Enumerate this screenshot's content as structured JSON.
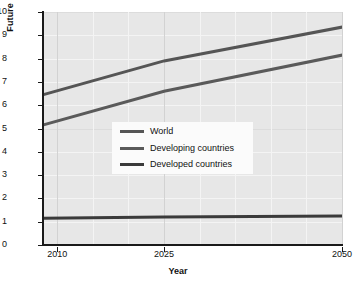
{
  "chart_data": {
    "type": "line",
    "title": "",
    "xlabel": "Year",
    "ylabel": "Future population (billions)",
    "xlim": [
      2008,
      2050
    ],
    "ylim": [
      0,
      10
    ],
    "x_ticks": [
      2010,
      2025,
      2050
    ],
    "x_tick_labels": [
      "2010",
      "2025",
      "2050"
    ],
    "y_ticks": [
      0,
      1,
      2,
      3,
      4,
      5,
      6,
      7,
      8,
      9,
      10
    ],
    "y_tick_labels": [
      "0",
      "1",
      "2",
      "3",
      "4",
      "5",
      "6",
      "7",
      "8",
      "9",
      "10"
    ],
    "grid": true,
    "legend_position": "center",
    "series": [
      {
        "name": "World",
        "color": "#555555",
        "x": [
          2008,
          2025,
          2050
        ],
        "values": [
          6.45,
          7.9,
          9.35
        ]
      },
      {
        "name": "Developing countries",
        "color": "#5a5a5a",
        "x": [
          2008,
          2025,
          2050
        ],
        "values": [
          5.15,
          6.6,
          8.15
        ]
      },
      {
        "name": "Developed countries",
        "color": "#3a3a3a",
        "x": [
          2008,
          2025,
          2050
        ],
        "values": [
          1.15,
          1.2,
          1.25
        ]
      }
    ]
  },
  "axes": {
    "y_title": "Future population (billions)",
    "x_title": "Year",
    "y_labels": [
      "10",
      "9",
      "8",
      "7",
      "6",
      "5",
      "4",
      "3",
      "2",
      "1",
      "0"
    ],
    "x_labels": [
      "2010",
      "2025",
      "2050"
    ]
  },
  "legend": {
    "items": [
      {
        "label": "World",
        "color": "#555555"
      },
      {
        "label": "Developing countries",
        "color": "#5a5a5a"
      },
      {
        "label": "Developed countries",
        "color": "#3a3a3a"
      }
    ]
  },
  "colors": {
    "plot_background": "#e7e7e7",
    "page_background": "#ffffff",
    "axis": "#1a1a1a",
    "gridline": "#f4f4f4",
    "legend_background": "#fbfbfb",
    "text": "#111111"
  }
}
